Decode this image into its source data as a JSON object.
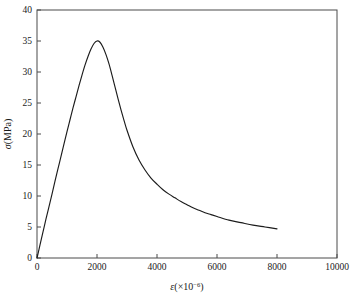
{
  "chart_data": {
    "type": "line",
    "title": "",
    "xlabel": "ε(×10⁻⁶)",
    "ylabel": "σ(MPa)",
    "xlabel_parts": {
      "symbol": "ε",
      "open": "(",
      "times": "×",
      "base": "10",
      "exponent": "-6",
      "close": ")"
    },
    "ylabel_parts": {
      "symbol": "σ",
      "unit": "(MPa)"
    },
    "xlim": [
      0,
      10000
    ],
    "ylim": [
      0,
      40
    ],
    "xticks": [
      0,
      2000,
      4000,
      6000,
      8000,
      10000
    ],
    "yticks": [
      0,
      5,
      10,
      15,
      20,
      25,
      30,
      35,
      40
    ],
    "xticklabels": [
      "0",
      "2000",
      "4000",
      "6000",
      "8000",
      "10000"
    ],
    "yticklabels": [
      "0",
      "5",
      "10",
      "15",
      "20",
      "25",
      "30",
      "35",
      "40"
    ],
    "grid": false,
    "legend": null,
    "legend_position": "none",
    "tick_direction": "in",
    "line_color": "#1c1c1c",
    "frame_color": "#4a4a4a",
    "background_color": "#ffffff",
    "peak": {
      "x": 2000,
      "y": 35.0
    },
    "series": [
      {
        "name": "stress-strain",
        "x": [
          0,
          100,
          200,
          300,
          400,
          500,
          600,
          700,
          800,
          900,
          1000,
          1100,
          1200,
          1300,
          1400,
          1500,
          1600,
          1700,
          1800,
          1900,
          2000,
          2100,
          2200,
          2300,
          2400,
          2500,
          2600,
          2700,
          2800,
          2900,
          3000,
          3200,
          3400,
          3600,
          3800,
          4000,
          4200,
          4400,
          4600,
          4800,
          5000,
          5200,
          5400,
          5600,
          5800,
          6000,
          6400,
          6800,
          7200,
          7600,
          8000
        ],
        "y": [
          0.0,
          2.1,
          4.2,
          6.3,
          8.3,
          10.3,
          12.4,
          14.4,
          16.4,
          18.4,
          20.4,
          22.3,
          24.2,
          26.0,
          27.8,
          29.5,
          31.1,
          32.5,
          33.7,
          34.6,
          35.0,
          34.8,
          34.0,
          32.8,
          31.3,
          29.5,
          27.6,
          25.7,
          23.9,
          22.2,
          20.6,
          17.9,
          15.8,
          14.2,
          12.9,
          11.9,
          11.0,
          10.3,
          9.7,
          9.1,
          8.6,
          8.1,
          7.7,
          7.3,
          7.0,
          6.7,
          6.1,
          5.7,
          5.3,
          5.0,
          4.7
        ]
      }
    ]
  },
  "geometry": {
    "plot_left": 37,
    "plot_right": 337,
    "plot_top": 10,
    "plot_bottom": 258,
    "tick_length": 4
  }
}
